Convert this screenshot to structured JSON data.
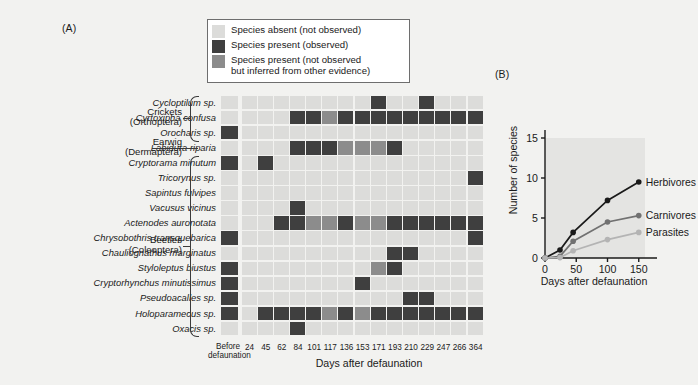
{
  "figure": {
    "panel_a_tag": "(A)",
    "panel_b_tag": "(B)"
  },
  "legend": {
    "items": [
      {
        "label": "Species absent (not observed)",
        "color": "#dcdcda",
        "name": "absent"
      },
      {
        "label": "Species present (observed)",
        "color": "#3f3f3f",
        "name": "present-observed"
      },
      {
        "label": "Species present (not observed\nbut inferred from other evidence)",
        "color": "#8c8c8c",
        "name": "present-inferred"
      }
    ]
  },
  "panel_a": {
    "before_label": "Before\ndefaunation",
    "x_axis_title": "Days after defaunation",
    "time_columns": [
      "24",
      "45",
      "62",
      "84",
      "101",
      "117",
      "136",
      "153",
      "171",
      "193",
      "210",
      "229",
      "247",
      "266",
      "364"
    ],
    "groups": [
      {
        "name": "Crickets\n(Orthoptera)",
        "rows": [
          0,
          2
        ]
      },
      {
        "name": "Earwig\n(Dermaptera)",
        "rows": [
          3,
          3
        ]
      },
      {
        "name": "Beetles\n(Coleoptera)",
        "rows": [
          4,
          15
        ]
      }
    ],
    "species": [
      "Cycloptilum sp.",
      "Cyrtoxipha confusa",
      "Orocharis sp.",
      "Labidura riparia",
      "Cryptorama minutum",
      "Tricorynus sp.",
      "Sapintus fulvipes",
      "Vacusus vicinus",
      "Actenodes auronotata",
      "Chrysobothris transquebarica",
      "Chauliognathus marginatus",
      "Styloleptus biustus",
      "Cryptorhynchus minutissimus",
      "Pseudoacalles sp.",
      "Holoparamecus sp.",
      "Oxacis sp."
    ],
    "legend_key": {
      "0": "absent",
      "1": "present-observed",
      "2": "present-inferred"
    },
    "before_column": [
      0,
      0,
      1,
      0,
      1,
      0,
      0,
      0,
      0,
      1,
      0,
      1,
      1,
      1,
      1,
      0
    ],
    "matrix": [
      [
        0,
        0,
        0,
        0,
        0,
        0,
        0,
        0,
        1,
        0,
        0,
        1,
        0,
        0,
        0
      ],
      [
        0,
        0,
        0,
        1,
        1,
        2,
        1,
        1,
        1,
        1,
        1,
        1,
        1,
        1,
        1
      ],
      [
        0,
        0,
        0,
        0,
        0,
        0,
        0,
        0,
        0,
        0,
        0,
        0,
        0,
        0,
        0
      ],
      [
        0,
        0,
        0,
        1,
        1,
        1,
        2,
        2,
        2,
        1,
        0,
        0,
        0,
        0,
        0
      ],
      [
        0,
        1,
        0,
        0,
        0,
        0,
        0,
        0,
        0,
        0,
        0,
        0,
        0,
        0,
        0
      ],
      [
        0,
        0,
        0,
        0,
        0,
        0,
        0,
        0,
        0,
        0,
        0,
        0,
        0,
        0,
        1
      ],
      [
        0,
        0,
        0,
        0,
        0,
        0,
        0,
        0,
        0,
        0,
        0,
        0,
        0,
        0,
        0
      ],
      [
        0,
        0,
        0,
        1,
        0,
        0,
        0,
        0,
        0,
        0,
        0,
        0,
        0,
        0,
        0
      ],
      [
        0,
        0,
        1,
        1,
        2,
        2,
        1,
        2,
        2,
        1,
        1,
        1,
        1,
        1,
        1
      ],
      [
        0,
        0,
        0,
        0,
        0,
        0,
        0,
        0,
        0,
        0,
        0,
        0,
        0,
        0,
        1
      ],
      [
        0,
        0,
        0,
        0,
        0,
        0,
        0,
        0,
        0,
        1,
        1,
        0,
        0,
        0,
        0
      ],
      [
        0,
        0,
        0,
        0,
        0,
        0,
        0,
        0,
        2,
        1,
        0,
        0,
        0,
        0,
        0
      ],
      [
        0,
        0,
        0,
        0,
        0,
        0,
        0,
        1,
        0,
        0,
        0,
        0,
        0,
        0,
        0
      ],
      [
        0,
        0,
        0,
        0,
        0,
        0,
        0,
        0,
        0,
        0,
        1,
        1,
        0,
        0,
        0
      ],
      [
        0,
        0,
        0,
        0,
        0,
        0,
        0,
        0,
        0,
        1,
        1,
        0,
        0,
        0,
        0
      ],
      [
        0,
        0,
        0,
        0,
        0,
        0,
        0,
        0,
        0,
        0,
        0,
        0,
        0,
        0,
        0
      ]
    ],
    "matrix_extra": {
      "row14_full": [
        0,
        1,
        1,
        1,
        1,
        2,
        1,
        2,
        1,
        1,
        1,
        1,
        1,
        1,
        1
      ],
      "row15_single": [
        0,
        0,
        0,
        1,
        0,
        0,
        0,
        0,
        0,
        0,
        0,
        0,
        0,
        0,
        0
      ]
    }
  },
  "chart_data": {
    "type": "line",
    "title": "",
    "xlabel": "Days after defaunation",
    "ylabel": "Number of species",
    "xlim": [
      0,
      160
    ],
    "ylim": [
      0,
      15
    ],
    "xticks": [
      "0",
      "50",
      "100",
      "150"
    ],
    "yticks": [
      "0",
      "5",
      "10",
      "15"
    ],
    "grid": false,
    "legend_position": "right-inline",
    "x": [
      0,
      24,
      45,
      100,
      150
    ],
    "series": [
      {
        "name": "Herbivores",
        "values": [
          0,
          1.0,
          3.2,
          7.2,
          9.5
        ],
        "color": "#1a1a1a"
      },
      {
        "name": "Carnivores",
        "values": [
          0,
          0.2,
          2.1,
          4.5,
          5.3
        ],
        "color": "#717171"
      },
      {
        "name": "Parasites",
        "values": [
          0,
          0.05,
          0.9,
          2.3,
          3.2
        ],
        "color": "#b4b4b4"
      }
    ]
  }
}
